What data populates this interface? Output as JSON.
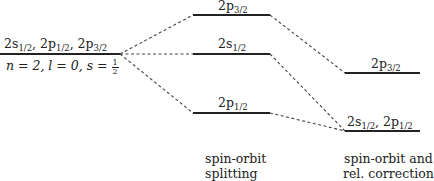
{
  "diagram": {
    "levels": {
      "unperturbed": {
        "label_top": [
          "2s",
          "1/2",
          ", 2p",
          "1/2",
          ", 2p",
          "3/2"
        ],
        "label_bottom_prefix": "n = 2, l = 0, s = ",
        "label_bottom_frac_num": "1",
        "label_bottom_frac_den": "2"
      },
      "spin_orbit": {
        "p32": {
          "main": "2p",
          "sub": "3/2"
        },
        "s12": {
          "main": "2s",
          "sub": "1/2"
        },
        "p12": {
          "main": "2p",
          "sub": "1/2"
        }
      },
      "relativistic": {
        "p32": {
          "main": "2p",
          "sub": "3/2"
        },
        "s12p12": {
          "main1": "2s",
          "sub1": "1/2",
          "sep": ", ",
          "main2": "2p",
          "sub2": "1/2"
        }
      }
    },
    "captions": {
      "middle_line1": "spin-orbit",
      "middle_line2": "splitting",
      "right_line1": "spin-orbit and",
      "right_line2": "rel. correction"
    },
    "colors": {
      "line": "#222222",
      "dashed": "#444444"
    }
  }
}
